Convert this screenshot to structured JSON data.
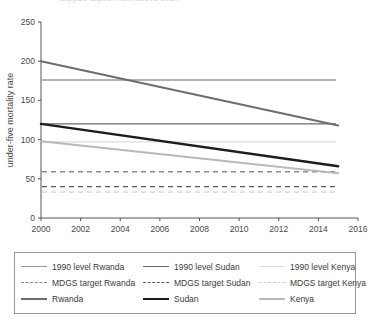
{
  "top_caption": "clipped caption text above chart",
  "chart_data": {
    "type": "line",
    "title": "",
    "xlabel": "",
    "ylabel": "under-five mortality rate",
    "xlim": [
      2000,
      2016
    ],
    "ylim": [
      0,
      250
    ],
    "xticks": [
      "2000",
      "2002",
      "2004",
      "2006",
      "2008",
      "2010",
      "2012",
      "2014",
      "2016"
    ],
    "yticks": [
      "0",
      "50",
      "100",
      "150",
      "200",
      "250"
    ],
    "grid": false,
    "legend_position": "below",
    "x": [
      2000,
      2015
    ],
    "series": [
      {
        "name": "Rwanda",
        "style": "solid",
        "color": "#6e6e6e",
        "width": 2.0,
        "values": [
          200,
          118
        ]
      },
      {
        "name": "Sudan",
        "style": "solid",
        "color": "#1c1c1c",
        "width": 2.4,
        "values": [
          120,
          66
        ]
      },
      {
        "name": "Kenya",
        "style": "solid",
        "color": "#b9b9b9",
        "width": 2.0,
        "values": [
          98,
          57
        ]
      }
    ],
    "reference_lines": [
      {
        "name": "1990 level Rwanda",
        "style": "solid",
        "color": "#9a9a9a",
        "value": 176
      },
      {
        "name": "1990 level Sudan",
        "style": "solid",
        "color": "#6b6b6b",
        "value": 120
      },
      {
        "name": "1990 level Kenya",
        "style": "solid",
        "color": "#dcdcdc",
        "value": 97
      },
      {
        "name": "MDGS target Rwanda",
        "style": "dashed",
        "color": "#8c8c8c",
        "value": 59
      },
      {
        "name": "MDGS target Sudan",
        "style": "dashed",
        "color": "#5a5a5a",
        "value": 40
      },
      {
        "name": "MDGS target Kenya",
        "style": "dashed",
        "color": "#d2d2d2",
        "value": 33
      }
    ]
  },
  "legend": {
    "rows": [
      [
        {
          "label": "1990 level Rwanda",
          "color": "#9a9a9a",
          "style": "solid",
          "width": 1
        },
        {
          "label": "1990 level Sudan",
          "color": "#6b6b6b",
          "style": "solid",
          "width": 1
        },
        {
          "label": "1990 level Kenya",
          "color": "#dcdcdc",
          "style": "solid",
          "width": 1
        }
      ],
      [
        {
          "label": "MDGS target Rwanda",
          "color": "#8c8c8c",
          "style": "dashed",
          "width": 1
        },
        {
          "label": "MDGS target Sudan",
          "color": "#5a5a5a",
          "style": "dashed",
          "width": 1
        },
        {
          "label": "MDGS target Kenya",
          "color": "#d2d2d2",
          "style": "dashed",
          "width": 1
        }
      ],
      [
        {
          "label": "Rwanda",
          "color": "#6e6e6e",
          "style": "solid",
          "width": 2.2
        },
        {
          "label": "Sudan",
          "color": "#1c1c1c",
          "style": "solid",
          "width": 2.6
        },
        {
          "label": "Kenya",
          "color": "#b9b9b9",
          "style": "solid",
          "width": 2.2
        }
      ]
    ]
  },
  "colors": {
    "axis": "#555555",
    "text": "#3b3b3b",
    "legend_border": "#9a9a9a",
    "background": "#ffffff"
  }
}
